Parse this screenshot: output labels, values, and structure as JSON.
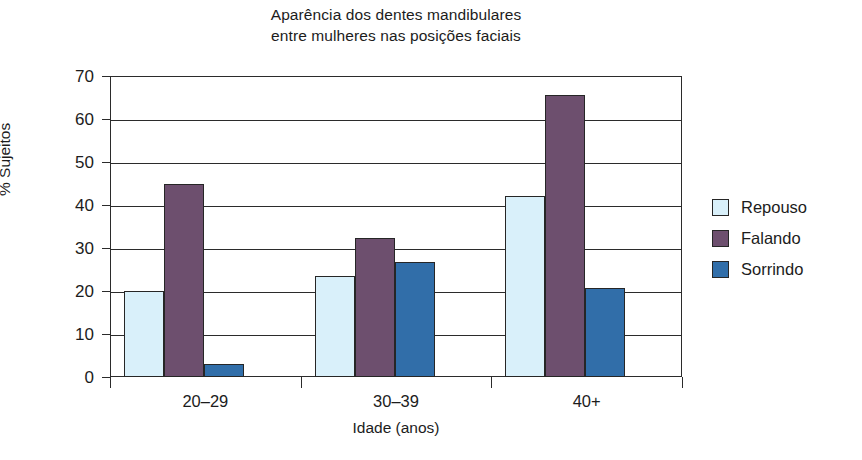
{
  "chart_data": {
    "type": "bar",
    "title": "Aparência dos dentes mandibulares\nentre mulheres nas posições faciais",
    "title_line1": "Aparência dos dentes mandibulares",
    "title_line2": "entre mulheres nas posições faciais",
    "xlabel": "Idade (anos)",
    "ylabel": "% Sujeitos",
    "categories": [
      "20–29",
      "30–39",
      "40+"
    ],
    "ylim": [
      0,
      70
    ],
    "yticks": [
      0,
      10,
      20,
      30,
      40,
      50,
      60,
      70
    ],
    "ytick_labels": [
      "0",
      "10",
      "20",
      "30",
      "40",
      "50",
      "60",
      "70"
    ],
    "grid": "horizontal",
    "legend_position": "right",
    "series": [
      {
        "name": "Repouso",
        "color": "#d9f0fa",
        "values": [
          20.0,
          23.5,
          42.0
        ]
      },
      {
        "name": "Falando",
        "color": "#6d4f6e",
        "values": [
          45.0,
          32.3,
          65.5
        ]
      },
      {
        "name": "Sorrindo",
        "color": "#316ea9",
        "values": [
          3.1,
          26.7,
          20.7
        ]
      }
    ]
  },
  "legend": {
    "items": [
      {
        "label": "Repouso",
        "color": "#d9f0fa"
      },
      {
        "label": "Falando",
        "color": "#6d4f6e"
      },
      {
        "label": "Sorrindo",
        "color": "#316ea9"
      }
    ]
  },
  "edge_artifact": {
    "text": ""
  }
}
